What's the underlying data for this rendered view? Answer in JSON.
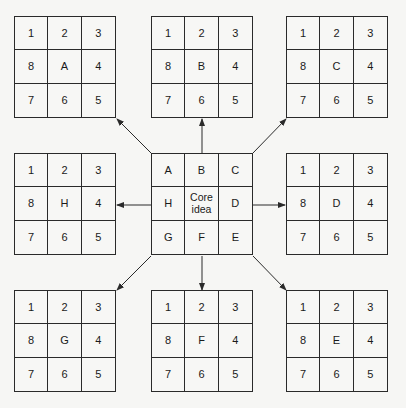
{
  "diagram": {
    "type": "lotus-blossom",
    "center": {
      "cells": [
        "A",
        "B",
        "C",
        "H",
        "Core\nidea",
        "D",
        "G",
        "F",
        "E"
      ],
      "core_label": "Core idea"
    },
    "outer_grids": [
      {
        "id": "A",
        "position": "top-left",
        "cells": [
          "1",
          "2",
          "3",
          "8",
          "A",
          "4",
          "7",
          "6",
          "5"
        ]
      },
      {
        "id": "B",
        "position": "top-center",
        "cells": [
          "1",
          "2",
          "3",
          "8",
          "B",
          "4",
          "7",
          "6",
          "5"
        ]
      },
      {
        "id": "C",
        "position": "top-right",
        "cells": [
          "1",
          "2",
          "3",
          "8",
          "C",
          "4",
          "7",
          "6",
          "5"
        ]
      },
      {
        "id": "H",
        "position": "middle-left",
        "cells": [
          "1",
          "2",
          "3",
          "8",
          "H",
          "4",
          "7",
          "6",
          "5"
        ]
      },
      {
        "id": "D",
        "position": "middle-right",
        "cells": [
          "1",
          "2",
          "3",
          "8",
          "D",
          "4",
          "7",
          "6",
          "5"
        ]
      },
      {
        "id": "G",
        "position": "bottom-left",
        "cells": [
          "1",
          "2",
          "3",
          "8",
          "G",
          "4",
          "7",
          "6",
          "5"
        ]
      },
      {
        "id": "F",
        "position": "bottom-center",
        "cells": [
          "1",
          "2",
          "3",
          "8",
          "F",
          "4",
          "7",
          "6",
          "5"
        ]
      },
      {
        "id": "E",
        "position": "bottom-right",
        "cells": [
          "1",
          "2",
          "3",
          "8",
          "E",
          "4",
          "7",
          "6",
          "5"
        ]
      }
    ],
    "arrows": [
      {
        "from": "center",
        "to": "A"
      },
      {
        "from": "center",
        "to": "B"
      },
      {
        "from": "center",
        "to": "C"
      },
      {
        "from": "center",
        "to": "D"
      },
      {
        "from": "center",
        "to": "E"
      },
      {
        "from": "center",
        "to": "F"
      },
      {
        "from": "center",
        "to": "G"
      },
      {
        "from": "center",
        "to": "H"
      }
    ],
    "colors": {
      "background": "#f6f6f4",
      "line": "#2a2a2a",
      "text": "#1a1a1a"
    }
  }
}
